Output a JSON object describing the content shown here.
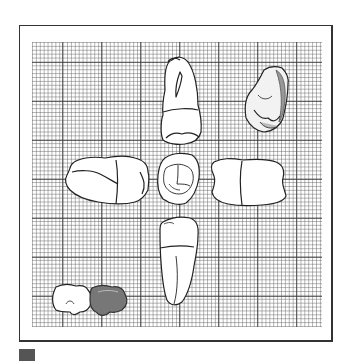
{
  "figure": {
    "views": [
      {
        "id": "top",
        "label": "mesial/distal view (upper)"
      },
      {
        "id": "top-right",
        "label": "oblique shaded view"
      },
      {
        "id": "left",
        "label": "lateral view (left)"
      },
      {
        "id": "center",
        "label": "occlusal view"
      },
      {
        "id": "right",
        "label": "lateral view (right)"
      },
      {
        "id": "bottom",
        "label": "root view (lower)"
      },
      {
        "id": "row",
        "label": "tooth row sketch with highlighted tooth"
      }
    ],
    "colors": {
      "line": "#222222",
      "grid": "#555555",
      "highlight": "#777777",
      "frame": "#333333",
      "marker": "#555555"
    }
  }
}
